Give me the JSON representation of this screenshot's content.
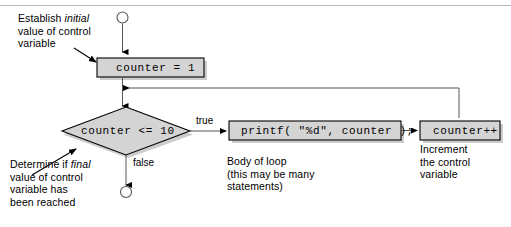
{
  "diagram": {
    "type": "flowchart",
    "colors": {
      "node_fill": "#d4d4d4",
      "node_stroke": "#000000",
      "line": "#000000",
      "rule": "#b9b9b9",
      "background": "#ffffff"
    }
  },
  "nodes": {
    "start_terminal": {
      "shape": "circle",
      "label": ""
    },
    "init": {
      "shape": "rectangle",
      "label": "counter = 1"
    },
    "condition": {
      "shape": "diamond",
      "label": "counter <= 10"
    },
    "body": {
      "shape": "rectangle",
      "label": "printf( \"%d\", counter );"
    },
    "increment": {
      "shape": "rectangle",
      "label": "counter++"
    },
    "end_terminal": {
      "shape": "circle",
      "label": ""
    }
  },
  "edge_labels": {
    "true": "true",
    "false": "false"
  },
  "annotations": {
    "establish": {
      "line1_pre": "Establish ",
      "line1_em": "initial",
      "line2": "value of control",
      "line3": "variable"
    },
    "determine": {
      "line1_pre": "Determine if ",
      "line1_em": "final",
      "line2": "value of control",
      "line3": "variable has",
      "line4": "been reached"
    },
    "body_of_loop": {
      "line1": "Body of loop",
      "line2": "(this may be many",
      "line3": "statements)"
    },
    "increment_note": {
      "line1": "Increment",
      "line2": "the control",
      "line3": "variable"
    }
  }
}
